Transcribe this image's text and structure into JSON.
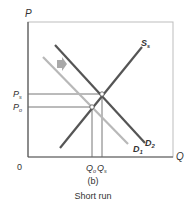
{
  "diagram": {
    "axis_labels": {
      "y": "P",
      "x": "Q",
      "origin": "0"
    },
    "price_labels": {
      "ps_main": "P",
      "ps_sub": "s",
      "po_main": "P",
      "po_sub": "o"
    },
    "quantity_labels": {
      "qo_main": "Q",
      "qo_sub": "o",
      "qs_main": "Q",
      "qs_sub": "s"
    },
    "curves": {
      "supply": {
        "main": "S",
        "sub": "s",
        "color": "#555555"
      },
      "demand2": {
        "main": "D",
        "sub": "2",
        "color": "#555555"
      },
      "demand1": {
        "main": "D",
        "sub": "1",
        "color": "#b8b8b8"
      }
    },
    "shift_arrow": {
      "direction": "right",
      "color": "#a9a9a9"
    },
    "panel_label": "(b)",
    "caption": "Short run"
  }
}
